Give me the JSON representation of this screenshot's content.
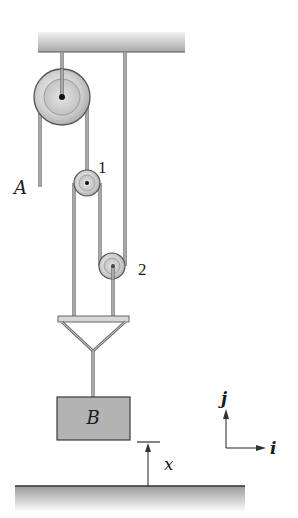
{
  "diagram": {
    "type": "pulley-system",
    "labels": {
      "rope_end": "A",
      "pulley_1": "1",
      "pulley_2": "2",
      "block": "B",
      "displacement": "x",
      "axis_vertical": "j",
      "axis_horizontal": "i"
    },
    "colors": {
      "rope": "#6e6e6e",
      "rope_light": "#d0d0d0",
      "block_fill": "#b3b3b3",
      "pulley_fill": "#d6d6d6",
      "support_dark": "#9a9a9a",
      "support_light": "#e8e8e8",
      "line": "#333333"
    }
  }
}
